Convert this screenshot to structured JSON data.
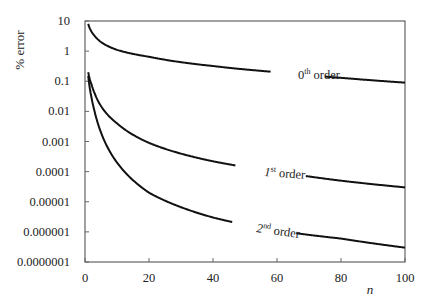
{
  "chart_data": {
    "type": "line",
    "title": "",
    "xlabel": "n",
    "ylabel": "% error",
    "xlim": [
      0,
      100
    ],
    "ylim": [
      1e-07,
      10
    ],
    "yscale": "log",
    "grid": false,
    "legend_position": "inline labels",
    "x_ticks": [
      "0",
      "20",
      "40",
      "60",
      "80",
      "100"
    ],
    "y_ticks": [
      "10",
      "1",
      "0.1",
      "0.01",
      "0.001",
      "0.0001",
      "0.00001",
      "0.000001",
      "0.0000001"
    ],
    "x": [
      1,
      2,
      3,
      5,
      10,
      20,
      40,
      60,
      80,
      100
    ],
    "series": [
      {
        "name": "0th order",
        "label_base": "0",
        "label_sup": "th",
        "label_tail": " order",
        "values": [
          8,
          4.5,
          3.2,
          2.0,
          1.1,
          0.65,
          0.32,
          0.2,
          0.13,
          0.09
        ]
      },
      {
        "name": "1st order",
        "label_base": "1",
        "label_sup": "st",
        "label_tail": " order",
        "values": [
          0.2,
          0.08,
          0.04,
          0.015,
          0.004,
          0.0009,
          0.00022,
          0.0001,
          5e-05,
          3e-05
        ]
      },
      {
        "name": "2nd order",
        "label_base": "2",
        "label_sup": "nd",
        "label_tail": " order",
        "values": [
          0.15,
          0.03,
          0.01,
          0.002,
          0.0002,
          2e-05,
          3e-06,
          1.1e-06,
          6e-07,
          3e-07
        ]
      }
    ],
    "annotations": [
      {
        "text": "0th order",
        "x": 68,
        "y": 0.12
      },
      {
        "text": "1st order",
        "x": 62,
        "y": 7e-05
      },
      {
        "text": "2nd order",
        "x": 60,
        "y": 1.5e-06
      }
    ]
  }
}
